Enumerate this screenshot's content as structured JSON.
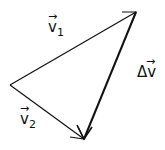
{
  "diagram": {
    "type": "vector-triangle",
    "stroke_color": "#111111",
    "background": "#ffffff",
    "vertices": {
      "left": [
        10,
        85
      ],
      "top": [
        136,
        12
      ],
      "bottom": [
        84,
        139
      ]
    },
    "vectors": [
      {
        "id": "v1",
        "from": "left",
        "to": "top",
        "label": "v",
        "subscript": "1",
        "arrow": "→"
      },
      {
        "id": "v2",
        "from": "left",
        "to": "bottom",
        "label": "v",
        "subscript": "2",
        "arrow": "→"
      },
      {
        "id": "dv",
        "from": "top",
        "to": "bottom",
        "label": "Δv",
        "subscript": "",
        "arrow": "→"
      }
    ]
  }
}
